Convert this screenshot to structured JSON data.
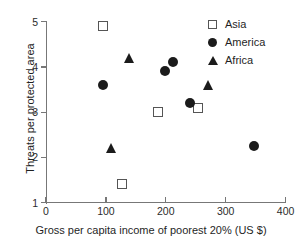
{
  "chart_data": {
    "type": "scatter",
    "title": "",
    "xlabel": "Gross per capita income of poorest 20%  (US $)",
    "ylabel": "Threats per protected area",
    "xlim": [
      0,
      400
    ],
    "ylim": [
      1,
      5
    ],
    "xticks": [
      "0",
      "100",
      "200",
      "300",
      "400"
    ],
    "xtick_values": [
      0,
      100,
      200,
      300,
      400
    ],
    "yticks": [
      "1",
      "2",
      "3",
      "4",
      "5"
    ],
    "ytick_values": [
      1,
      2,
      3,
      4,
      5
    ],
    "grid": false,
    "legend_position": "top-right",
    "series": [
      {
        "name": "Asia",
        "marker": "open-square",
        "color": "#555555",
        "points": [
          {
            "x": 95,
            "y": 4.9
          },
          {
            "x": 187,
            "y": 3.0
          },
          {
            "x": 254,
            "y": 3.1
          },
          {
            "x": 127,
            "y": 1.4
          }
        ]
      },
      {
        "name": "America",
        "marker": "filled-circle",
        "color": "#1b1b1b",
        "points": [
          {
            "x": 95,
            "y": 3.6
          },
          {
            "x": 198,
            "y": 3.9
          },
          {
            "x": 212,
            "y": 4.1
          },
          {
            "x": 241,
            "y": 3.2
          },
          {
            "x": 347,
            "y": 2.25
          }
        ]
      },
      {
        "name": "Africa",
        "marker": "filled-triangle",
        "color": "#1b1b1b",
        "points": [
          {
            "x": 140,
            "y": 4.2
          },
          {
            "x": 271,
            "y": 3.6
          },
          {
            "x": 110,
            "y": 2.2
          }
        ]
      }
    ]
  },
  "legend": {
    "items": [
      {
        "label": "Asia",
        "marker": "open-square-icon"
      },
      {
        "label": "America",
        "marker": "filled-circle-icon"
      },
      {
        "label": "Africa",
        "marker": "filled-triangle-icon"
      }
    ]
  }
}
